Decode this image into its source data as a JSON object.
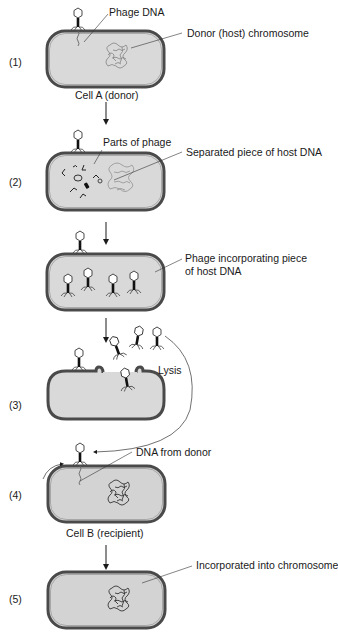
{
  "steps": [
    {
      "number": "(1)",
      "labels": {
        "phage_dna": "Phage DNA",
        "donor_chromosome": "Donor (host) chromosome",
        "cell_caption": "Cell A (donor)"
      }
    },
    {
      "number": "(2)",
      "labels": {
        "parts_of_phage": "Parts of phage",
        "separated_dna": "Separated piece of host DNA"
      }
    },
    {
      "number": "",
      "labels": {
        "phage_incorporating_line1": "Phage incorporating piece",
        "phage_incorporating_line2": "of host DNA"
      }
    },
    {
      "number": "(3)",
      "labels": {
        "lysis": "Lysis"
      }
    },
    {
      "number": "(4)",
      "labels": {
        "dna_from_donor": "DNA from donor",
        "cell_caption": "Cell B (recipient)"
      }
    },
    {
      "number": "(5)",
      "labels": {
        "incorporated": "Incorporated into chromosome"
      }
    }
  ],
  "colors": {
    "cell_fill": "#d9d9d9",
    "cell_outline": "#4a4a4a",
    "dna": "#555555",
    "text": "#1a1a1a",
    "arrow": "#1a1a1a"
  }
}
